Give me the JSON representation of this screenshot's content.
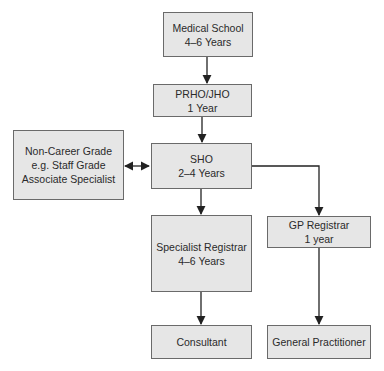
{
  "diagram": {
    "colors": {
      "box_fill": "#e6e6e6",
      "box_border": "#6a6a6a",
      "arrow": "#222222",
      "text": "#2a2a2a"
    },
    "nodes": [
      {
        "id": "medical_school",
        "line1": "Medical School",
        "line2": "4–6 Years"
      },
      {
        "id": "prho_jho",
        "line1": "PRHO/JHO",
        "line2": "1 Year"
      },
      {
        "id": "sho",
        "line1": "SHO",
        "line2": "2–4 Years"
      },
      {
        "id": "non_career",
        "line1": "Non-Career Grade",
        "line2": "e.g. Staff Grade",
        "line3": "Associate Specialist"
      },
      {
        "id": "specialist_registrar",
        "line1": "Specialist Registrar",
        "line2": "4–6 Years"
      },
      {
        "id": "gp_registrar",
        "line1": "GP Registrar",
        "line2": "1 year"
      },
      {
        "id": "consultant",
        "line1": "Consultant"
      },
      {
        "id": "general_practitioner",
        "line1": "General Practitioner"
      }
    ],
    "edges": [
      {
        "from": "medical_school",
        "to": "prho_jho",
        "type": "arrow"
      },
      {
        "from": "prho_jho",
        "to": "sho",
        "type": "arrow"
      },
      {
        "from": "sho",
        "to": "non_career",
        "type": "bidirectional"
      },
      {
        "from": "sho",
        "to": "specialist_registrar",
        "type": "arrow"
      },
      {
        "from": "sho",
        "to": "gp_registrar",
        "type": "arrow"
      },
      {
        "from": "specialist_registrar",
        "to": "consultant",
        "type": "arrow"
      },
      {
        "from": "gp_registrar",
        "to": "general_practitioner",
        "type": "arrow"
      }
    ]
  }
}
